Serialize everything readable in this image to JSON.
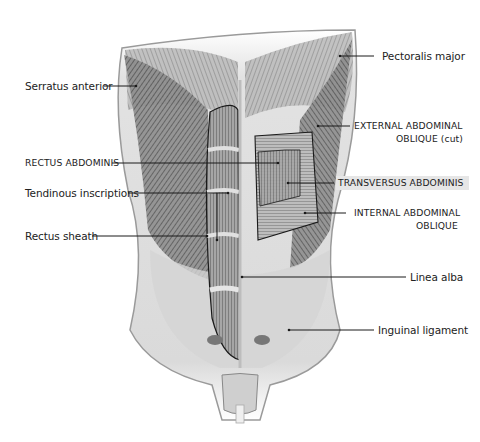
{
  "figure": {
    "labels": {
      "serratus_anterior": "Serratus anterior",
      "pectoralis_major": "Pectoralis major",
      "external_oblique_line1": "EXTERNAL ABDOMINAL",
      "external_oblique_line2": "OBLIQUE (cut)",
      "rectus_abdominis": "RECTUS ABDOMINIS",
      "tendinous_inscriptions": "Tendinous inscriptions",
      "transversus_abdominis": "TRANSVERSUS ABDOMINIS",
      "rectus_sheath": "Rectus sheath",
      "internal_oblique_line1": "INTERNAL ABDOMINAL",
      "internal_oblique_line2": "OBLIQUE",
      "linea_alba": "Linea alba",
      "inguinal_ligament": "Inguinal ligament"
    },
    "colors": {
      "line": "#1a1a1a",
      "muscle_dark": "#555555",
      "muscle_mid": "#8a8a8a",
      "skin": "#d9d9d9",
      "highlight": "#e6e6e6"
    }
  }
}
